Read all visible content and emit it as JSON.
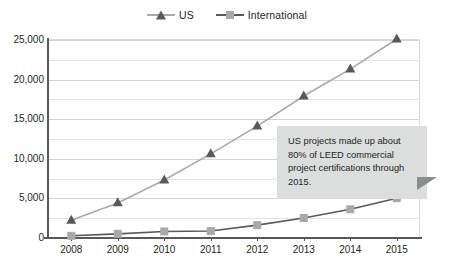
{
  "chart_data": {
    "type": "line",
    "title": "",
    "subtitle": "",
    "xlabel": "",
    "ylabel": "",
    "categories": [
      "2008",
      "2009",
      "2010",
      "2011",
      "2012",
      "2013",
      "2014",
      "2015"
    ],
    "series": [
      {
        "name": "US",
        "marker": "triangle",
        "color": "#58595b",
        "line_color": "#a7a9ac",
        "values": [
          2100,
          4300,
          7200,
          10500,
          14000,
          17800,
          21200,
          25000
        ]
      },
      {
        "name": "International",
        "marker": "square",
        "color": "#a7a9ac",
        "line_color": "#58595b",
        "values": [
          150,
          400,
          700,
          750,
          1500,
          2400,
          3500,
          4900
        ]
      }
    ],
    "ylim": [
      0,
      25000
    ],
    "yticks": [
      0,
      5000,
      10000,
      15000,
      20000,
      25000
    ],
    "ytick_labels": [
      "0",
      "5,000",
      "10,000",
      "15,000",
      "20,000",
      "25,000"
    ],
    "minor_yticks": [
      2500,
      7500,
      12500,
      17500,
      22500
    ],
    "grid": true,
    "legend_position": "top-center"
  },
  "legend": {
    "entries": [
      {
        "label": "US",
        "marker": "triangle-marker",
        "color": "#58595b"
      },
      {
        "label": "International",
        "marker": "square-marker",
        "color": "#a7a9ac"
      }
    ]
  },
  "callout": {
    "text": "US projects made up about 80% of LEED commercial project certifications through 2015.",
    "background": "#dcdddd",
    "tail_color": "#8b8c8e"
  },
  "colors": {
    "us_marker": "#58595b",
    "us_line": "#a7a9ac",
    "intl_marker": "#a7a9ac",
    "intl_line": "#58595b",
    "grid": "#e3e4e5",
    "axis": "#58595b",
    "text": "#231f20",
    "background": "#ffffff"
  }
}
